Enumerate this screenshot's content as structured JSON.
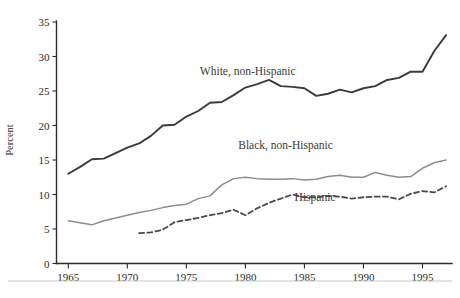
{
  "chart_data": {
    "type": "line",
    "title": "",
    "subtitle": "",
    "xlabel": "",
    "ylabel": "Percent",
    "xlim": [
      1964,
      1997.5
    ],
    "ylim": [
      0,
      35
    ],
    "xticks": [
      1965,
      1970,
      1975,
      1980,
      1985,
      1990,
      1995
    ],
    "yticks": [
      0,
      5,
      10,
      15,
      20,
      25,
      30,
      35
    ],
    "grid": false,
    "legend_position": "inline-annotations",
    "colors": {
      "white_non_hispanic": "#3a3a3a",
      "black_non_hispanic": "#8d8d8d",
      "hispanic": "#4a4a4a",
      "axis": "#2b2b2b",
      "background": "#ffffff"
    },
    "series": [
      {
        "name": "White, non-Hispanic",
        "style": "solid",
        "color": "#3a3a3a",
        "label_x": 1980.2,
        "label_y": 27.3,
        "x": [
          1965,
          1966,
          1967,
          1968,
          1969,
          1970,
          1971,
          1972,
          1973,
          1974,
          1975,
          1976,
          1977,
          1978,
          1979,
          1980,
          1981,
          1982,
          1983,
          1984,
          1985,
          1986,
          1987,
          1988,
          1989,
          1990,
          1991,
          1992,
          1993,
          1994,
          1995,
          1996,
          1997
        ],
        "y": [
          13.0,
          14.0,
          15.1,
          15.2,
          16.0,
          16.8,
          17.4,
          18.5,
          20.0,
          20.1,
          21.3,
          22.1,
          23.3,
          23.4,
          24.4,
          25.5,
          26.0,
          26.6,
          25.7,
          25.6,
          25.4,
          24.3,
          24.6,
          25.2,
          24.8,
          25.4,
          25.7,
          26.6,
          26.9,
          27.8,
          27.8,
          30.8,
          33.1
        ]
      },
      {
        "name": "Black, non-Hispanic",
        "style": "solid",
        "color": "#8d8d8d",
        "label_x": 1983.4,
        "label_y": 16.6,
        "x": [
          1965,
          1966,
          1967,
          1968,
          1969,
          1970,
          1971,
          1972,
          1973,
          1974,
          1975,
          1976,
          1977,
          1978,
          1979,
          1980,
          1981,
          1982,
          1983,
          1984,
          1985,
          1986,
          1987,
          1988,
          1989,
          1990,
          1991,
          1992,
          1993,
          1994,
          1995,
          1996,
          1997
        ],
        "y": [
          6.2,
          5.9,
          5.6,
          6.2,
          6.6,
          7.0,
          7.4,
          7.7,
          8.1,
          8.4,
          8.6,
          9.4,
          9.8,
          11.4,
          12.3,
          12.5,
          12.3,
          12.2,
          12.2,
          12.3,
          12.1,
          12.2,
          12.6,
          12.8,
          12.5,
          12.5,
          13.2,
          12.8,
          12.5,
          12.6,
          13.8,
          14.6,
          15.0
        ]
      },
      {
        "name": "Hispanic",
        "style": "dashed",
        "color": "#4a4a4a",
        "label_x": 1985.9,
        "label_y": 9.0,
        "x": [
          1971,
          1972,
          1973,
          1974,
          1975,
          1976,
          1977,
          1978,
          1979,
          1980,
          1981,
          1982,
          1983,
          1984,
          1985,
          1986,
          1987,
          1988,
          1989,
          1990,
          1991,
          1992,
          1993,
          1994,
          1995,
          1996,
          1997
        ],
        "y": [
          4.4,
          4.5,
          4.9,
          6.0,
          6.3,
          6.6,
          7.0,
          7.3,
          7.8,
          7.0,
          8.0,
          8.8,
          9.4,
          10.0,
          9.6,
          9.6,
          9.8,
          9.7,
          9.4,
          9.6,
          9.7,
          9.7,
          9.3,
          10.1,
          10.5,
          10.3,
          11.2
        ]
      }
    ]
  },
  "axis": {
    "y_title": "Percent",
    "x_tick_labels": [
      "1965",
      "1970",
      "1975",
      "1980",
      "1985",
      "1990",
      "1995"
    ],
    "y_tick_labels": [
      "0",
      "5",
      "10",
      "15",
      "20",
      "25",
      "30",
      "35"
    ]
  },
  "annotations": {
    "white_label": "White, non-Hispanic",
    "black_label": "Black, non-Hispanic",
    "hispanic_label": "Hispanic"
  },
  "caption": {
    "text": ""
  }
}
